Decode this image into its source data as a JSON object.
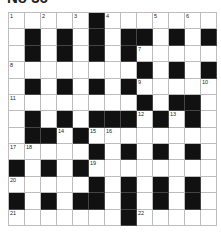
{
  "puzzle": {
    "title": "No 36",
    "rows": 13,
    "cols": 13,
    "grid": [
      ".....#.......",
      ".#.#.#.##.#.#",
      ".#.#.#.#.....",
      "........#.#.#",
      ".#.#.#.#.....",
      "........#.##.",
      ".#.#.###.#.#.",
      ".##.#........",
      ".....#.#.#.#.",
      "#.#.#........",
      ".....#.#.#.#.",
      "#.#.##.#.#.#.",
      ".......#....."
    ],
    "numbers": [
      {
        "r": 0,
        "c": 0,
        "n": "1"
      },
      {
        "r": 0,
        "c": 2,
        "n": "2"
      },
      {
        "r": 0,
        "c": 4,
        "n": "3"
      },
      {
        "r": 0,
        "c": 6,
        "n": "4"
      },
      {
        "r": 0,
        "c": 9,
        "n": "5"
      },
      {
        "r": 0,
        "c": 11,
        "n": "6"
      },
      {
        "r": 2,
        "c": 8,
        "n": "7"
      },
      {
        "r": 3,
        "c": 0,
        "n": "8"
      },
      {
        "r": 4,
        "c": 8,
        "n": "9"
      },
      {
        "r": 4,
        "c": 12,
        "n": "10"
      },
      {
        "r": 5,
        "c": 0,
        "n": "11"
      },
      {
        "r": 6,
        "c": 8,
        "n": "12"
      },
      {
        "r": 6,
        "c": 10,
        "n": "13"
      },
      {
        "r": 7,
        "c": 3,
        "n": "14"
      },
      {
        "r": 7,
        "c": 5,
        "n": "15"
      },
      {
        "r": 7,
        "c": 6,
        "n": "16"
      },
      {
        "r": 8,
        "c": 0,
        "n": "17"
      },
      {
        "r": 8,
        "c": 1,
        "n": "18"
      },
      {
        "r": 9,
        "c": 5,
        "n": "19"
      },
      {
        "r": 10,
        "c": 0,
        "n": "20"
      },
      {
        "r": 12,
        "c": 0,
        "n": "21"
      },
      {
        "r": 12,
        "c": 8,
        "n": "22"
      }
    ]
  }
}
